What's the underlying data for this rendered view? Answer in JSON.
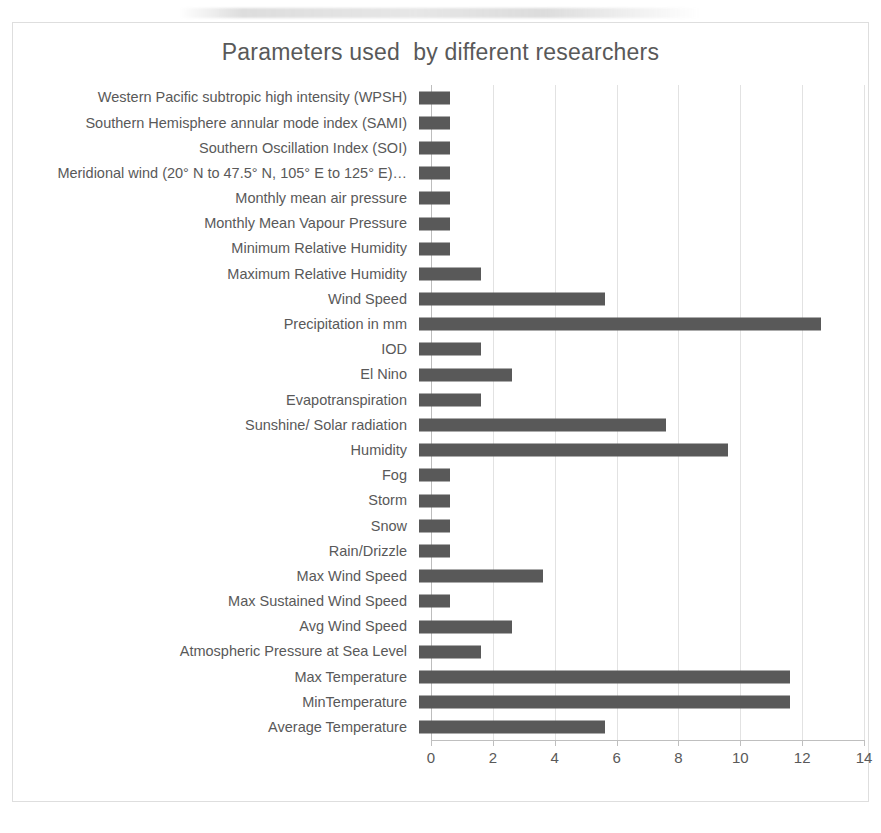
{
  "figure": {
    "caption": "",
    "frame_border_color": "#dedede"
  },
  "chart_data": {
    "type": "bar",
    "orientation": "horizontal",
    "title": "Parameters used  by different researchers",
    "xlabel": "",
    "ylabel": "",
    "xlim": [
      0,
      14
    ],
    "xticks": [
      0,
      2,
      4,
      6,
      8,
      10,
      12,
      14
    ],
    "xtick_labels": [
      "0",
      "2",
      "4",
      "6",
      "8",
      "10",
      "12",
      "14"
    ],
    "grid": "vertical",
    "legend": "none",
    "bar_color": "#595959",
    "categories": [
      "Western Pacific subtropic high intensity (WPSH)",
      "Southern Hemisphere annular mode index (SAMI)",
      "Southern Oscillation Index (SOI)",
      "Meridional wind (20° N to 47.5° N, 105° E to 125° E)…",
      "Monthly mean air pressure",
      "Monthly Mean Vapour Pressure",
      "Minimum Relative Humidity",
      "Maximum Relative Humidity",
      "Wind Speed",
      "Precipitation in mm",
      "IOD",
      "El Nino",
      "Evapotranspiration",
      "Sunshine/ Solar  radiation",
      "Humidity",
      "Fog",
      "Storm",
      "Snow",
      "Rain/Drizzle",
      "Max Wind Speed",
      "Max Sustained Wind Speed",
      "Avg Wind Speed",
      "Atmospheric Pressure at Sea Level",
      "Max Temperature",
      "MinTemperature",
      "Average Temperature"
    ],
    "values": [
      1,
      1,
      1,
      1,
      1,
      1,
      1,
      2,
      6,
      13,
      2,
      3,
      2,
      8,
      10,
      1,
      1,
      1,
      1,
      4,
      1,
      3,
      2,
      12,
      12,
      6
    ]
  }
}
